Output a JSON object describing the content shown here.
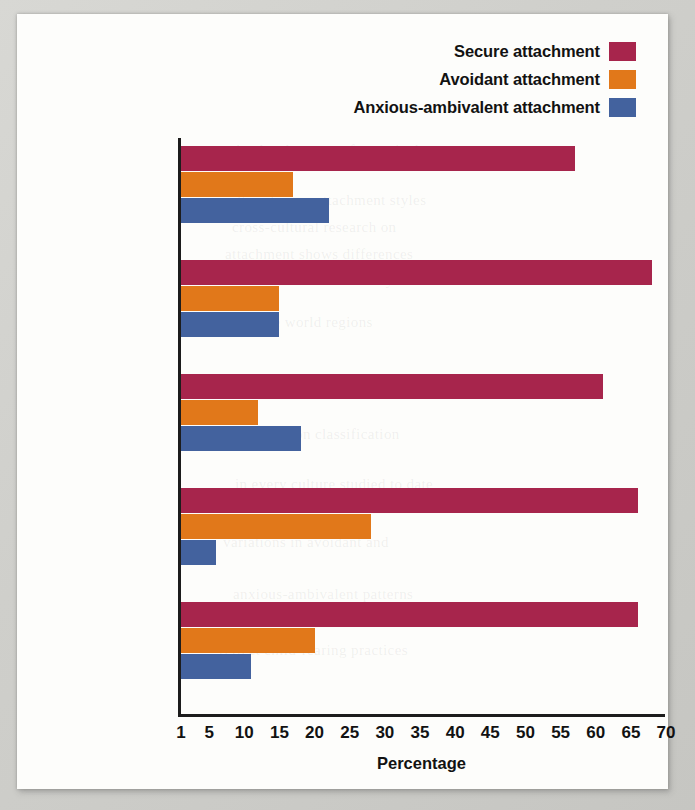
{
  "chart_data": {
    "type": "bar",
    "orientation": "horizontal",
    "title": "",
    "xlabel": "Percentage",
    "ylabel": "",
    "xlim": [
      1,
      70
    ],
    "xticks": [
      1,
      5,
      10,
      15,
      20,
      25,
      30,
      35,
      40,
      45,
      50,
      55,
      60,
      65,
      70
    ],
    "grid": false,
    "legend_position": "top-right",
    "categories": [
      "Africa",
      "China",
      "Japan (Tokyo)",
      "Western Europe",
      "United States"
    ],
    "series": [
      {
        "name": "Secure attachment",
        "color": "#a7254c",
        "values": [
          57,
          68,
          61,
          66,
          66
        ]
      },
      {
        "name": "Avoidant attachment",
        "color": "#e1781a",
        "values": [
          17,
          15,
          12,
          28,
          20
        ]
      },
      {
        "name": "Anxious-ambivalent attachment",
        "color": "#43629e",
        "values": [
          22,
          15,
          18,
          6,
          11
        ]
      }
    ]
  },
  "legend": {
    "items": [
      {
        "label": "Secure attachment",
        "color": "#a7254c"
      },
      {
        "label": "Avoidant attachment",
        "color": "#e1781a"
      },
      {
        "label": "Anxious-ambivalent attachment",
        "color": "#43629e"
      }
    ]
  },
  "axis": {
    "x_title": "Percentage",
    "ticks": [
      "1",
      "5",
      "10",
      "15",
      "20",
      "25",
      "30",
      "35",
      "40",
      "45",
      "50",
      "55",
      "60",
      "65",
      "70"
    ]
  },
  "categories": [
    "Africa",
    "China",
    "Japan (Tokyo)",
    "Western Europe",
    "United States"
  ],
  "colors": {
    "secure": "#a7254c",
    "avoidant": "#e1781a",
    "anxious": "#43629e",
    "axis": "#1c1c1c",
    "panel_background": "#fdfdfb",
    "page_background": "#cfcfcb"
  },
  "ghost_text": [
    "the development of a particular",
    "culture has on attachment styles",
    "cross-cultural research on",
    "attachment shows differences",
    "in the distribution of styles",
    "across the world regions",
    "secure attachment remains the",
    "most common classification",
    "in every culture studied to date",
    "variations in avoidant and",
    "anxious-ambivalent patterns",
    "reflect child-rearing practices"
  ]
}
